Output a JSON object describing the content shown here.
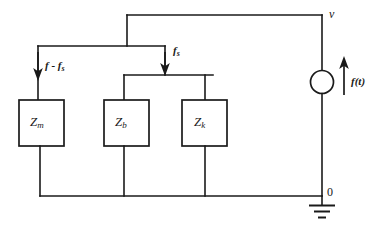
{
  "diagram": {
    "type": "circuit-schematic",
    "colors": {
      "line": "#1a1a1a",
      "background": "#ffffff"
    },
    "components": [
      {
        "id": "zm",
        "label_base": "Z",
        "label_sub": "m",
        "kind": "impedance-box"
      },
      {
        "id": "zb",
        "label_base": "Z",
        "label_sub": "b",
        "kind": "impedance-box"
      },
      {
        "id": "zk",
        "label_base": "Z",
        "label_sub": "k",
        "kind": "impedance-box"
      }
    ],
    "source": {
      "id": "current-source",
      "kind": "circle-source",
      "label": "f(t)",
      "arrow_direction": "up"
    },
    "flow_labels": [
      {
        "id": "f-minus-fs",
        "base": "f",
        "operator": " - ",
        "term_base": "f",
        "term_sub": "s",
        "text": "f - f",
        "sub": "s",
        "arrow_direction": "down"
      },
      {
        "id": "fs",
        "base": "f",
        "sub": "s",
        "text": "f",
        "arrow_direction": "down"
      }
    ],
    "nodes": [
      {
        "id": "node-v",
        "label": "v",
        "position": "top-right"
      },
      {
        "id": "node-zero",
        "label": "0",
        "position": "bottom-right"
      }
    ],
    "ground": {
      "id": "ground-symbol",
      "bars": 3
    }
  }
}
